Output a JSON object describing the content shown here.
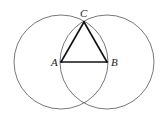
{
  "diagram": {
    "points": [
      {
        "id": "A",
        "label": "A",
        "x": 61,
        "y": 62
      },
      {
        "id": "B",
        "label": "B",
        "x": 107,
        "y": 62
      },
      {
        "id": "C",
        "label": "C",
        "x": 84,
        "y": 22
      }
    ],
    "circles": [
      {
        "center": "A",
        "radius": 47
      },
      {
        "center": "B",
        "radius": 47
      }
    ],
    "segments": [
      [
        "A",
        "B"
      ],
      [
        "B",
        "C"
      ],
      [
        "C",
        "A"
      ]
    ],
    "colors": {
      "circle": "#555555",
      "triangle": "#111111",
      "background": "#ffffff"
    }
  }
}
